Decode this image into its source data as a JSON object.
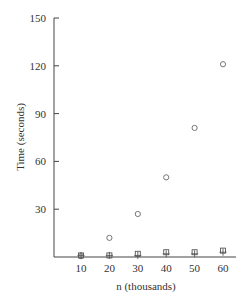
{
  "chart_data": {
    "type": "scatter",
    "title": "",
    "xlabel": "n (thousands)",
    "ylabel": "Time (seconds)",
    "x": [
      10,
      20,
      30,
      40,
      50,
      60
    ],
    "xticks": [
      "10",
      "20",
      "30",
      "40",
      "50",
      "60"
    ],
    "yticks": [
      "30",
      "60",
      "90",
      "120",
      "150"
    ],
    "ylim": [
      0,
      150
    ],
    "xlim": [
      0,
      65
    ],
    "grid": false,
    "legend": null,
    "series": [
      {
        "name": "circle",
        "marker": "circle",
        "values": [
          0.5,
          12,
          27,
          50,
          81,
          121
        ]
      },
      {
        "name": "square",
        "marker": "square",
        "values": [
          1,
          1,
          2,
          3,
          3,
          4
        ]
      },
      {
        "name": "plus",
        "marker": "plus",
        "values": [
          1,
          1,
          1,
          2,
          2,
          3
        ]
      }
    ]
  }
}
